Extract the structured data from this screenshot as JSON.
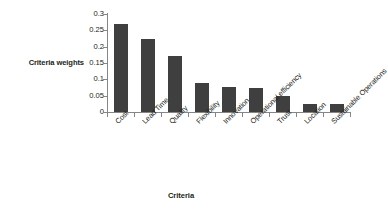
{
  "chart_data": {
    "type": "bar",
    "title": "",
    "xlabel": "Criteria",
    "ylabel": "Criteria weights",
    "categories": [
      "Cost",
      "Lead Time",
      "Quality",
      "Flexibility",
      "Innovation",
      "Operational efficiency",
      "Trust",
      "Location",
      "Sustainable Operations"
    ],
    "values": [
      0.27,
      0.225,
      0.17,
      0.089,
      0.076,
      0.072,
      0.05,
      0.026,
      0.024
    ],
    "ylim": [
      0,
      0.3
    ],
    "ytick_labels": [
      "0",
      "0.05",
      "0.1",
      "0.15",
      "0.2",
      "0.25",
      "0.3"
    ],
    "ytick_values": [
      0,
      0.05,
      0.1,
      0.15,
      0.2,
      0.25,
      0.3
    ],
    "grid": false,
    "legend": false,
    "legend_position": "none",
    "bar_color": "#3f3f3f",
    "axis_color": "#868686",
    "background_color": "#ffffff",
    "xtick_label_rotation": -45
  }
}
